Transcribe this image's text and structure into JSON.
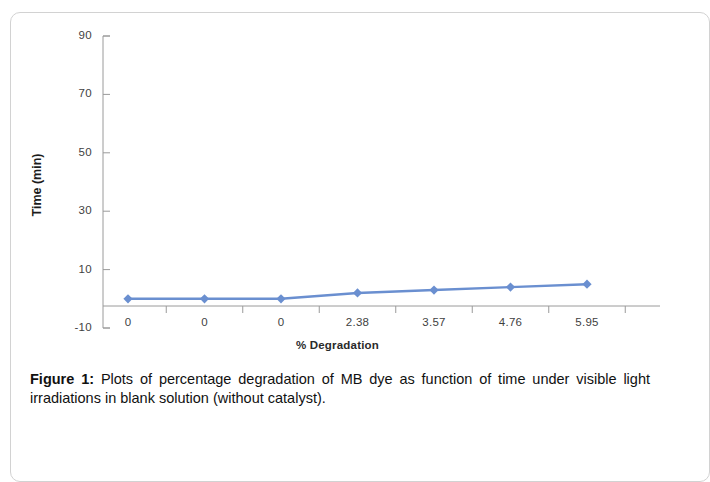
{
  "figure": {
    "caption_label": "Figure 1:",
    "caption_text": " Plots of percentage degradation of MB dye as function of time under visible light irradiations in blank solution (without catalyst)."
  },
  "chart_data": {
    "type": "line",
    "title": "",
    "xlabel": "% Degradation",
    "ylabel": "Time (min)",
    "categories": [
      "0",
      "0",
      "0",
      "2.38",
      "3.57",
      "4.76",
      "5.95"
    ],
    "values": [
      0,
      0,
      0,
      2,
      3,
      4,
      5
    ],
    "series": [
      {
        "name": "Time (min)",
        "values": [
          0,
          0,
          0,
          2,
          3,
          4,
          5
        ],
        "color": "#6A8FD0",
        "marker": "diamond"
      }
    ],
    "ylim": [
      -10,
      90
    ],
    "yticks": [
      90,
      70,
      50,
      30,
      10,
      -10
    ],
    "ytick_labels": [
      "90",
      "70",
      "50",
      "30",
      "10",
      "-10"
    ],
    "grid": false,
    "legend": "none",
    "axis_color": "#9a9a9a",
    "marker_color": "#6A8FD0",
    "line_color": "#6A8FD0"
  }
}
